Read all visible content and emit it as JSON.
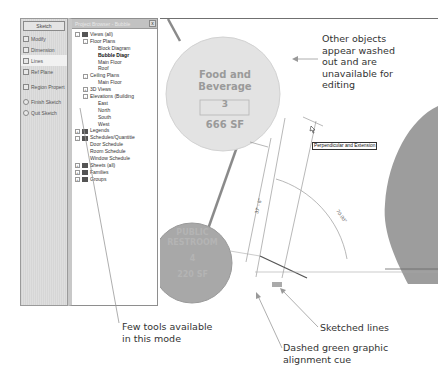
{
  "sketch_panel": {
    "title": "Sketch",
    "tools": [
      {
        "label": "Modify",
        "icon": "arrow-cursor-icon",
        "active": false
      },
      {
        "label": "Dimension",
        "icon": "dimension-icon",
        "active": false
      },
      {
        "label": "Lines",
        "icon": "lines-icon",
        "active": true
      },
      {
        "label": "Ref Plane",
        "icon": "ref-plane-icon",
        "active": false
      },
      {
        "label": "Region Propert",
        "icon": "region-properties-icon",
        "active": false
      },
      {
        "label": "Finish Sketch",
        "icon": "finish-sketch-icon",
        "active": false
      },
      {
        "label": "Quit Sketch",
        "icon": "quit-sketch-icon",
        "active": false
      }
    ]
  },
  "project_browser": {
    "title": "Project Browser - Bubble",
    "close": "x",
    "nodes": [
      {
        "label": "Views (all)",
        "level": 0,
        "expander": "-",
        "icon": "views-icon"
      },
      {
        "label": "Floor Plans",
        "level": 1,
        "expander": "-"
      },
      {
        "label": "Block Diagram",
        "level": 2
      },
      {
        "label": "Bubble Diagr",
        "level": 2,
        "bold": true
      },
      {
        "label": "Main Floor",
        "level": 2
      },
      {
        "label": "Roof",
        "level": 2
      },
      {
        "label": "Ceiling Plans",
        "level": 1,
        "expander": "-"
      },
      {
        "label": "Main Floor",
        "level": 2
      },
      {
        "label": "3D Views",
        "level": 1,
        "expander": "+"
      },
      {
        "label": "Elevations (Building",
        "level": 1,
        "expander": "-"
      },
      {
        "label": "East",
        "level": 2
      },
      {
        "label": "North",
        "level": 2
      },
      {
        "label": "South",
        "level": 2
      },
      {
        "label": "West",
        "level": 2
      },
      {
        "label": "Legends",
        "level": 0,
        "expander": "+",
        "icon": "legends-icon"
      },
      {
        "label": "Schedules/Quantitie",
        "level": 0,
        "expander": "-",
        "icon": "schedules-icon"
      },
      {
        "label": "Door Schedule",
        "level": 1
      },
      {
        "label": "Room Schedule",
        "level": 1
      },
      {
        "label": "Window Schedule",
        "level": 1
      },
      {
        "label": "Sheets (all)",
        "level": 0,
        "expander": "+",
        "icon": "sheets-icon"
      },
      {
        "label": "Families",
        "level": 0,
        "expander": "+",
        "icon": "families-icon"
      },
      {
        "label": "Groups",
        "level": 0,
        "expander": "+",
        "icon": "groups-icon"
      }
    ]
  },
  "canvas": {
    "room_bubble": {
      "name_line1": "Food and",
      "name_line2": "Beverage",
      "number": "3",
      "area": "666 SF"
    },
    "dark_bubble": {
      "name_line1": "PUBLIC",
      "name_line2": "RESTROOM",
      "number": "4",
      "area": "220 SF"
    },
    "dimension_length": "37' - 6\"",
    "dimension_angle": "70.00°",
    "tooltip": "Perpendicular and Extension"
  },
  "callouts": {
    "washed_out": [
      "Other objects",
      "appear washed",
      "out and are",
      "unavailable for",
      "editing"
    ],
    "few_tools": [
      "Few tools available",
      "in this mode"
    ],
    "sketched_lines": [
      "Sketched lines"
    ],
    "alignment_cue": [
      "Dashed green graphic",
      "alignment cue"
    ]
  },
  "colors": {
    "washed_bubble": "#e3e3e3",
    "mid_bubble": "#a9a9a9",
    "dark_region": "#9b9b9b",
    "callout_text": "#333333",
    "leader_line": "#999999"
  }
}
